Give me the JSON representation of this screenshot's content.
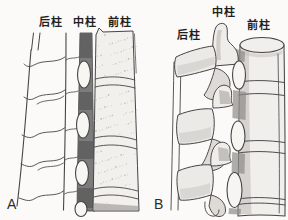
{
  "colors": {
    "paper": "#fbfaf8",
    "ink": "#454545",
    "canal_gray": "#7c7c7c",
    "canal_dark_gray": "#5e5e5e",
    "bone_fill": "#f2f0ec",
    "shade_gray": "#b3b0ac",
    "stipple_gray": "#97928a"
  },
  "figure": {
    "panels": [
      {
        "letter": "A",
        "labels": {
          "posterior": "后柱",
          "middle": "中柱",
          "anterior": "前柱"
        }
      },
      {
        "letter": "B",
        "labels": {
          "middle": "中柱",
          "posterior": "后柱",
          "anterior": "前柱"
        }
      }
    ]
  }
}
